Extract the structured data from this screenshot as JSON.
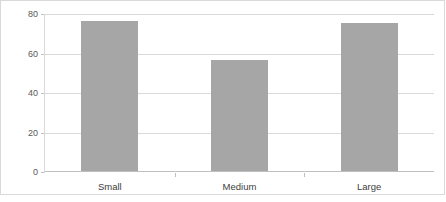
{
  "chart_data": {
    "type": "bar",
    "title": "",
    "subtitle": "",
    "xlabel": "",
    "ylabel": "",
    "categories": [
      "Small",
      "Medium",
      "Large"
    ],
    "values": [
      76,
      56,
      75
    ],
    "series": [
      {
        "name": "",
        "values": [
          76,
          56,
          75
        ]
      }
    ],
    "ylim": [
      0,
      80
    ],
    "yticks": [
      0,
      20,
      40,
      60,
      80
    ],
    "ytick_labels": [
      "0",
      "20",
      "40",
      "60",
      "80"
    ],
    "grid": "horizontal",
    "legend": "none",
    "bar_color": "#a6a6a6",
    "gridline_color": "#d9d9d9",
    "axis_text_color": "#595959",
    "category_text_color": "#404040",
    "plot_background": "#ffffff",
    "annotations": []
  }
}
